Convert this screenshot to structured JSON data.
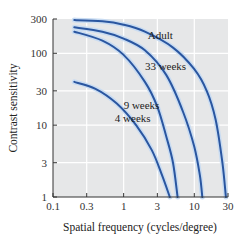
{
  "chart_data": {
    "type": "line",
    "title": "",
    "xlabel": "Spatial frequency (cycles/degree)",
    "ylabel": "Contrast sensitivity",
    "xscale": "log",
    "yscale": "log",
    "xlim": [
      0.1,
      30
    ],
    "ylim": [
      1,
      300
    ],
    "xticks": [
      0.1,
      0.3,
      1,
      3,
      10,
      30
    ],
    "xtick_labels": [
      "0.1",
      "0.3",
      "1",
      "3",
      "10",
      "30"
    ],
    "yticks": [
      1,
      3,
      10,
      30,
      100,
      300
    ],
    "ytick_labels": [
      "1",
      "3",
      "10",
      "30",
      "100",
      "300"
    ],
    "grid": true,
    "legend": "inline labels",
    "colors": {
      "line": "#2a56a0",
      "plot_bg": "#e6e7e8",
      "grid": "#ffffff",
      "glow": "#c9dcf2"
    },
    "series": [
      {
        "name": "Adult",
        "label": "Adult",
        "x": [
          0.2,
          0.5,
          1,
          2,
          5,
          10,
          15,
          20,
          25,
          28
        ],
        "y": [
          290,
          280,
          250,
          200,
          120,
          60,
          30,
          12,
          3,
          1
        ]
      },
      {
        "name": "33 weeks",
        "label": "33 weeks",
        "x": [
          0.2,
          0.5,
          1,
          2,
          4,
          7,
          10,
          12,
          13
        ],
        "y": [
          230,
          200,
          160,
          110,
          50,
          15,
          5,
          2,
          1
        ]
      },
      {
        "name": "9 weeks",
        "label": "9 weeks",
        "x": [
          0.2,
          0.5,
          1,
          2,
          3,
          4,
          5,
          5.8
        ],
        "y": [
          200,
          150,
          95,
          40,
          18,
          7,
          3,
          1
        ]
      },
      {
        "name": "4 weeks",
        "label": "4 weeks",
        "x": [
          0.2,
          0.4,
          0.8,
          1.5,
          2.5,
          3.5,
          4.5
        ],
        "y": [
          40,
          32,
          20,
          10,
          4.5,
          2,
          1
        ]
      }
    ],
    "label_positions": {
      "Adult": [
        2.2,
        160
      ],
      "33 weeks": [
        2.0,
        58
      ],
      "9 weeks": [
        1.0,
        17
      ],
      "4 weeks": [
        0.75,
        11
      ]
    }
  }
}
